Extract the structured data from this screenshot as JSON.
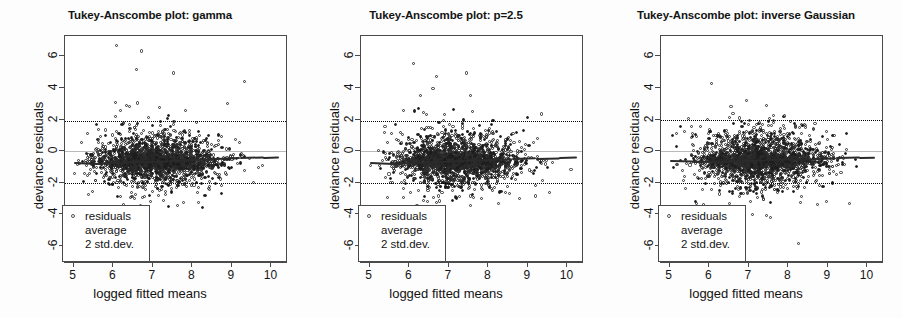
{
  "figure": {
    "panel_count": 3,
    "background": "#ffffff",
    "axis_color": "#4a4a4a",
    "point_color": "#2c2c2c",
    "zero_line_color": "#b9b9b9",
    "average_line_color": "#2b2b2b",
    "reference_line_style": "dotted"
  },
  "axes": {
    "xlabel": "logged fitted means",
    "ylabel": "deviance residuals",
    "xticks": [
      "5",
      "6",
      "7",
      "8",
      "9",
      "10"
    ],
    "xtick_values": [
      5,
      6,
      7,
      8,
      9,
      10
    ],
    "yticks": [
      "6",
      "4",
      "2",
      "0",
      "-2",
      "-4",
      "-6"
    ],
    "ytick_values": [
      6,
      4,
      2,
      0,
      -2,
      -4,
      -6
    ],
    "xlim": [
      4.78,
      10.42
    ],
    "ylim": [
      -7.1,
      7.3
    ]
  },
  "legend": {
    "items": [
      {
        "label": "residuals",
        "marker": "open-circle"
      },
      {
        "label": "average",
        "marker": "line"
      },
      {
        "label": "2 std.dev.",
        "marker": "dotted-line"
      }
    ]
  },
  "panels": [
    {
      "id": "gamma",
      "title": "Tukey-Anscombe plot: gamma",
      "left": 0,
      "ref_lines": [
        1.92,
        -2.02
      ],
      "zero_line": 0,
      "seed": 10117
    },
    {
      "id": "p25",
      "title": "Tukey-Anscombe plot: p=2.5",
      "left": 296,
      "ref_lines": [
        1.9,
        -2.05
      ],
      "zero_line": 0,
      "seed": 20231
    },
    {
      "id": "inverse-gaussian",
      "title": "Tukey-Anscombe plot: inverse Gaussian",
      "left": 596,
      "ref_lines": [
        1.95,
        -2.0
      ],
      "zero_line": 0,
      "seed": 33391
    }
  ],
  "chart_data": {
    "type": "scatter",
    "xlabel": "logged fitted means",
    "ylabel": "deviance residuals",
    "xlim": [
      4.78,
      10.42
    ],
    "ylim": [
      -7.1,
      7.3
    ],
    "xticks": [
      5,
      6,
      7,
      8,
      9,
      10
    ],
    "yticks": [
      -6,
      -4,
      -2,
      0,
      2,
      4,
      6
    ],
    "grid": false,
    "legend_position": "bottom-left",
    "legend_entries": [
      "residuals",
      "average",
      "2 std.dev."
    ],
    "series": [
      {
        "name": "gamma",
        "panel": 0,
        "n_points": 2400,
        "x_range": [
          5.0,
          10.2
        ],
        "x_mode": 7.0,
        "residual_center": -0.55,
        "residual_spread": 0.95,
        "band_upper": 1.92,
        "band_lower": -2.02,
        "average_line": [
          {
            "x": 5.0,
            "y": -0.72
          },
          {
            "x": 5.6,
            "y": -0.78
          },
          {
            "x": 6.2,
            "y": -0.7
          },
          {
            "x": 6.8,
            "y": -0.62
          },
          {
            "x": 7.4,
            "y": -0.58
          },
          {
            "x": 8.0,
            "y": -0.52
          },
          {
            "x": 8.6,
            "y": -0.46
          },
          {
            "x": 9.2,
            "y": -0.4
          },
          {
            "x": 9.8,
            "y": -0.36
          },
          {
            "x": 10.2,
            "y": -0.33
          }
        ],
        "outliers": [
          {
            "x": 6.08,
            "y": 6.7
          },
          {
            "x": 6.72,
            "y": 6.35
          },
          {
            "x": 6.58,
            "y": 5.15
          },
          {
            "x": 7.52,
            "y": 4.95
          },
          {
            "x": 9.33,
            "y": 4.42
          },
          {
            "x": 6.05,
            "y": 3.1
          },
          {
            "x": 6.62,
            "y": 3.05
          },
          {
            "x": 8.88,
            "y": 3.0
          },
          {
            "x": 6.42,
            "y": 2.85
          },
          {
            "x": 7.18,
            "y": 2.78
          },
          {
            "x": 6.18,
            "y": 2.6
          },
          {
            "x": 7.82,
            "y": 2.55
          }
        ]
      },
      {
        "name": "p=2.5",
        "panel": 1,
        "n_points": 2400,
        "x_range": [
          5.0,
          10.25
        ],
        "x_mode": 7.1,
        "residual_center": -0.55,
        "residual_spread": 0.97,
        "band_upper": 1.9,
        "band_lower": -2.05,
        "average_line": [
          {
            "x": 5.0,
            "y": -0.7
          },
          {
            "x": 5.6,
            "y": -0.76
          },
          {
            "x": 6.2,
            "y": -0.7
          },
          {
            "x": 6.8,
            "y": -0.63
          },
          {
            "x": 7.4,
            "y": -0.57
          },
          {
            "x": 8.0,
            "y": -0.52
          },
          {
            "x": 8.6,
            "y": -0.47
          },
          {
            "x": 9.2,
            "y": -0.42
          },
          {
            "x": 9.8,
            "y": -0.38
          },
          {
            "x": 10.25,
            "y": -0.35
          }
        ],
        "outliers": [
          {
            "x": 6.1,
            "y": 5.55
          },
          {
            "x": 7.45,
            "y": 4.95
          },
          {
            "x": 6.68,
            "y": 4.75
          },
          {
            "x": 7.55,
            "y": 3.5
          },
          {
            "x": 6.6,
            "y": 3.95
          },
          {
            "x": 5.85,
            "y": 2.55
          },
          {
            "x": 6.35,
            "y": 2.45
          },
          {
            "x": 9.35,
            "y": 2.35
          },
          {
            "x": 6.9,
            "y": 2.3
          },
          {
            "x": 8.25,
            "y": -3.35
          },
          {
            "x": 7.55,
            "y": -2.85
          },
          {
            "x": 9.55,
            "y": -2.6
          }
        ]
      },
      {
        "name": "inverse Gaussian",
        "panel": 2,
        "n_points": 2400,
        "x_range": [
          5.0,
          10.2
        ],
        "x_mode": 7.2,
        "residual_center": -0.5,
        "residual_spread": 1.0,
        "band_upper": 1.95,
        "band_lower": -2.0,
        "average_line": [
          {
            "x": 5.0,
            "y": -0.58
          },
          {
            "x": 5.6,
            "y": -0.62
          },
          {
            "x": 6.2,
            "y": -0.6
          },
          {
            "x": 6.8,
            "y": -0.56
          },
          {
            "x": 7.4,
            "y": -0.52
          },
          {
            "x": 8.0,
            "y": -0.48
          },
          {
            "x": 8.6,
            "y": -0.44
          },
          {
            "x": 9.2,
            "y": -0.4
          },
          {
            "x": 9.8,
            "y": -0.36
          },
          {
            "x": 10.2,
            "y": -0.34
          }
        ],
        "outliers": [
          {
            "x": 6.05,
            "y": 4.3
          },
          {
            "x": 6.95,
            "y": 3.2
          },
          {
            "x": 7.45,
            "y": 2.9
          },
          {
            "x": 6.55,
            "y": 2.8
          },
          {
            "x": 7.62,
            "y": 2.25
          },
          {
            "x": 5.95,
            "y": 1.98
          },
          {
            "x": 8.25,
            "y": -5.85
          },
          {
            "x": 7.45,
            "y": -4.1
          },
          {
            "x": 9.55,
            "y": -3.3
          },
          {
            "x": 5.68,
            "y": -3.3
          },
          {
            "x": 6.52,
            "y": -3.35
          },
          {
            "x": 7.05,
            "y": -3.2
          }
        ]
      }
    ]
  }
}
